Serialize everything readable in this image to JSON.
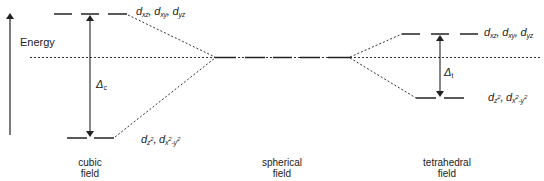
{
  "diagram": {
    "axis": {
      "label": "Energy"
    },
    "fields": [
      {
        "id": "cubic",
        "line1": "cubic",
        "line2": "field"
      },
      {
        "id": "spherical",
        "line1": "spherical",
        "line2": "field"
      },
      {
        "id": "tetrahedral",
        "line1": "tetrahedral",
        "line2": "field"
      }
    ],
    "orbital_sets": {
      "t2": {
        "d1": "d",
        "s1": "xz",
        "sep1": ", ",
        "d2": "d",
        "s2": "xy",
        "sep2": ", ",
        "d3": "d",
        "s3": "yz"
      },
      "e": {
        "d1": "d",
        "s1": "z",
        "p1": "2",
        "sep": ", ",
        "d2": "d",
        "s2a": "x",
        "p2a": "2",
        "s2b": "-y",
        "p2b": "2"
      }
    },
    "splittings": {
      "cubic": {
        "symbol": "Δ",
        "sub": "c"
      },
      "tetrahedral": {
        "symbol": "Δ",
        "sub": "t"
      }
    },
    "colors": {
      "line": "#222222",
      "background": "#ffffff"
    }
  }
}
